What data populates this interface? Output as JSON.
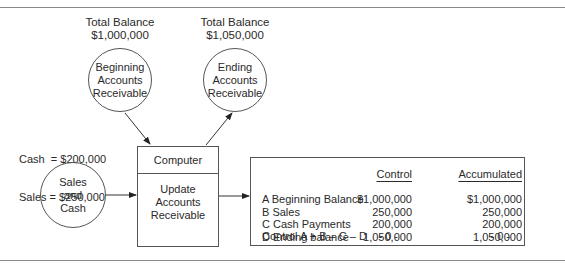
{
  "diagram": {
    "beginning_total": {
      "label": "Total Balance",
      "value": "$1,000,000"
    },
    "ending_total": {
      "label": "Total Balance",
      "value": "$1,050,000"
    },
    "beginning_ar": [
      "Beginning",
      "Accounts",
      "Receivable"
    ],
    "ending_ar": [
      "Ending",
      "Accounts",
      "Receivable"
    ],
    "inputs": {
      "cash": "Cash  = $200,000",
      "sales": "Sales = $250,000"
    },
    "sales_cash": [
      "Sales",
      "and",
      "Cash"
    ],
    "computer": {
      "header": "Computer",
      "process": [
        "Update",
        "Accounts",
        "Receivable"
      ]
    },
    "report": {
      "headers": [
        "",
        "Control",
        "Accumulated"
      ],
      "rows": [
        {
          "label": "A  Beginning Balance",
          "control": "$1,000,000",
          "accumulated": "$1,000,000"
        },
        {
          "label": "B  Sales",
          "control": "250,000",
          "accumulated": "250,000"
        },
        {
          "label": "C  Cash Payments",
          "control": "200,000",
          "accumulated": "200,000"
        },
        {
          "label": "D  Ending balance",
          "control": "1,050,000",
          "accumulated": "1,050,000"
        }
      ],
      "control_row": {
        "label": "Control A + B – C – D",
        "control": "- 0 -",
        "accumulated": "- 0 -"
      }
    }
  }
}
